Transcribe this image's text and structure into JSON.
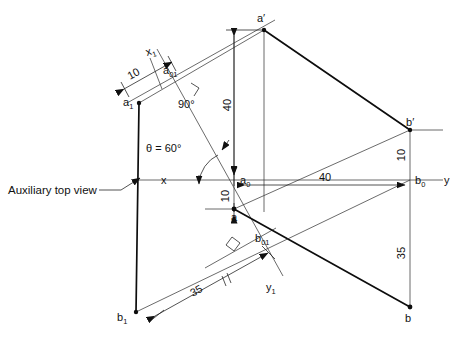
{
  "drawing": {
    "title": "Auxiliary top view projection - line a-b",
    "annotation_note": "Auxiliary top view",
    "axes": {
      "x_label": "x",
      "y_label": "y",
      "x1_label": "x",
      "x1_sub": "1",
      "y1_label": "y",
      "y1_sub": "1"
    },
    "points": [
      {
        "name": "a-prime",
        "label": "a",
        "sup": "′",
        "x": 264,
        "y": 30
      },
      {
        "name": "b-prime",
        "label": "b",
        "sup": "′",
        "x": 410,
        "y": 130
      },
      {
        "name": "a-zero",
        "label": "a",
        "sub": "0",
        "x": 234,
        "y": 180
      },
      {
        "name": "b-zero",
        "label": "b",
        "sub": "0",
        "x": 410,
        "y": 180
      },
      {
        "name": "a-top",
        "label": "a",
        "sub": "",
        "x": 234,
        "y": 209
      },
      {
        "name": "b-top",
        "label": "b",
        "sub": "",
        "x": 410,
        "y": 307
      },
      {
        "name": "a-one",
        "label": "a",
        "sub": "1",
        "x": 139,
        "y": 103
      },
      {
        "name": "b-one",
        "label": "b",
        "sub": "1",
        "x": 136,
        "y": 312
      },
      {
        "name": "a-zero-one",
        "label": "a",
        "sub": "01",
        "x": 172,
        "y": 78
      },
      {
        "name": "b-zero-one",
        "label": "b",
        "sub": "01",
        "x": 252,
        "y": 236
      }
    ],
    "dimensions": [
      {
        "name": "dim-10-auxiliary",
        "value": "10",
        "orientation": "oblique"
      },
      {
        "name": "dim-40-vertical",
        "value": "40",
        "orientation": "vertical"
      },
      {
        "name": "dim-10-a0-a",
        "value": "10",
        "orientation": "vertical"
      },
      {
        "name": "dim-40-horizontal",
        "value": "40",
        "orientation": "horizontal"
      },
      {
        "name": "dim-10-bprime-b0",
        "value": "10",
        "orientation": "vertical"
      },
      {
        "name": "dim-35-vertical",
        "value": "35",
        "orientation": "vertical"
      },
      {
        "name": "dim-35-oblique",
        "value": "35",
        "orientation": "oblique"
      }
    ],
    "angles": [
      {
        "name": "angle-theta",
        "value": "θ = 60°"
      },
      {
        "name": "angle-ninety",
        "value": "90°"
      }
    ],
    "colors": {
      "line_thick": "#0d0d0d",
      "line_thin": "#3a3a3a",
      "dimension": "#1a1a1a",
      "background": "#ffffff",
      "text": "#111111"
    }
  }
}
